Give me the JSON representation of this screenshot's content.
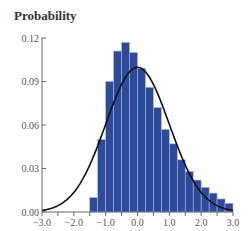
{
  "chart_data": {
    "type": "bar",
    "title": "Probability",
    "xlabel": "",
    "ylabel": "Probability",
    "xlim": [
      -3.0,
      3.0
    ],
    "ylim": [
      0.0,
      0.12
    ],
    "grid": false,
    "x_ticks": [
      "−3.0",
      "−2.0",
      "−1.0",
      "0.0",
      "1.0",
      "2.0",
      "3.0"
    ],
    "x_tick_values": [
      -3,
      -2,
      -1,
      0,
      1,
      2,
      3
    ],
    "y_ticks": [
      "0.00",
      "0.03",
      "0.06",
      "0.09",
      "0.12"
    ],
    "y_tick_values": [
      0.0,
      0.03,
      0.06,
      0.09,
      0.12
    ],
    "bin_width": 0.25,
    "bin_starts": [
      -1.5,
      -1.25,
      -1.0,
      -0.75,
      -0.5,
      -0.25,
      0.0,
      0.25,
      0.5,
      0.75,
      1.0,
      1.25,
      1.5,
      1.75,
      2.0,
      2.25,
      2.5,
      2.75
    ],
    "series": [
      {
        "name": "Histogram",
        "type": "bar",
        "color": "#2e4a9a",
        "values": [
          0.01,
          0.05,
          0.09,
          0.111,
          0.117,
          0.11,
          0.099,
          0.086,
          0.072,
          0.057,
          0.047,
          0.036,
          0.028,
          0.022,
          0.017,
          0.013,
          0.009,
          0.006
        ]
      },
      {
        "name": "Normal curve",
        "type": "line",
        "color": "#111111",
        "mean": 0.0,
        "sd": 1.0,
        "scale": 0.25
      }
    ]
  }
}
